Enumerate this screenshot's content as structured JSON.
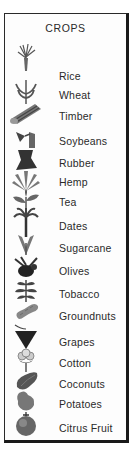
{
  "legend": {
    "title": "CROPS",
    "items": [
      {
        "label": "Rice",
        "icon": "rice-icon",
        "top": 54
      },
      {
        "label": "Wheat",
        "icon": "wheat-icon",
        "top": 75
      },
      {
        "label": "Timber",
        "icon": "timber-icon",
        "top": 96
      },
      {
        "label": "Soybeans",
        "icon": "soybeans-icon",
        "top": 121
      },
      {
        "label": "Rubber",
        "icon": "rubber-icon",
        "top": 143
      },
      {
        "label": "Hemp",
        "icon": "hemp-icon",
        "top": 162
      },
      {
        "label": "Tea",
        "icon": "tea-icon",
        "top": 182
      },
      {
        "label": "Dates",
        "icon": "dates-palm-icon",
        "top": 206
      },
      {
        "label": "Sugarcane",
        "icon": "sugarcane-icon",
        "top": 228
      },
      {
        "label": "Olives",
        "icon": "olives-icon",
        "top": 251
      },
      {
        "label": "Tobacco",
        "icon": "tobacco-icon",
        "top": 274
      },
      {
        "label": "Groundnuts",
        "icon": "groundnuts-icon",
        "top": 296
      },
      {
        "label": "Grapes",
        "icon": "grapes-icon",
        "top": 322
      },
      {
        "label": "Cotton",
        "icon": "cotton-icon",
        "top": 343
      },
      {
        "label": "Coconuts",
        "icon": "coconuts-icon",
        "top": 364
      },
      {
        "label": "Potatoes",
        "icon": "potatoes-icon",
        "top": 384
      },
      {
        "label": "Citrus Fruit",
        "icon": "citrus-fruit-icon",
        "top": 408
      }
    ]
  }
}
